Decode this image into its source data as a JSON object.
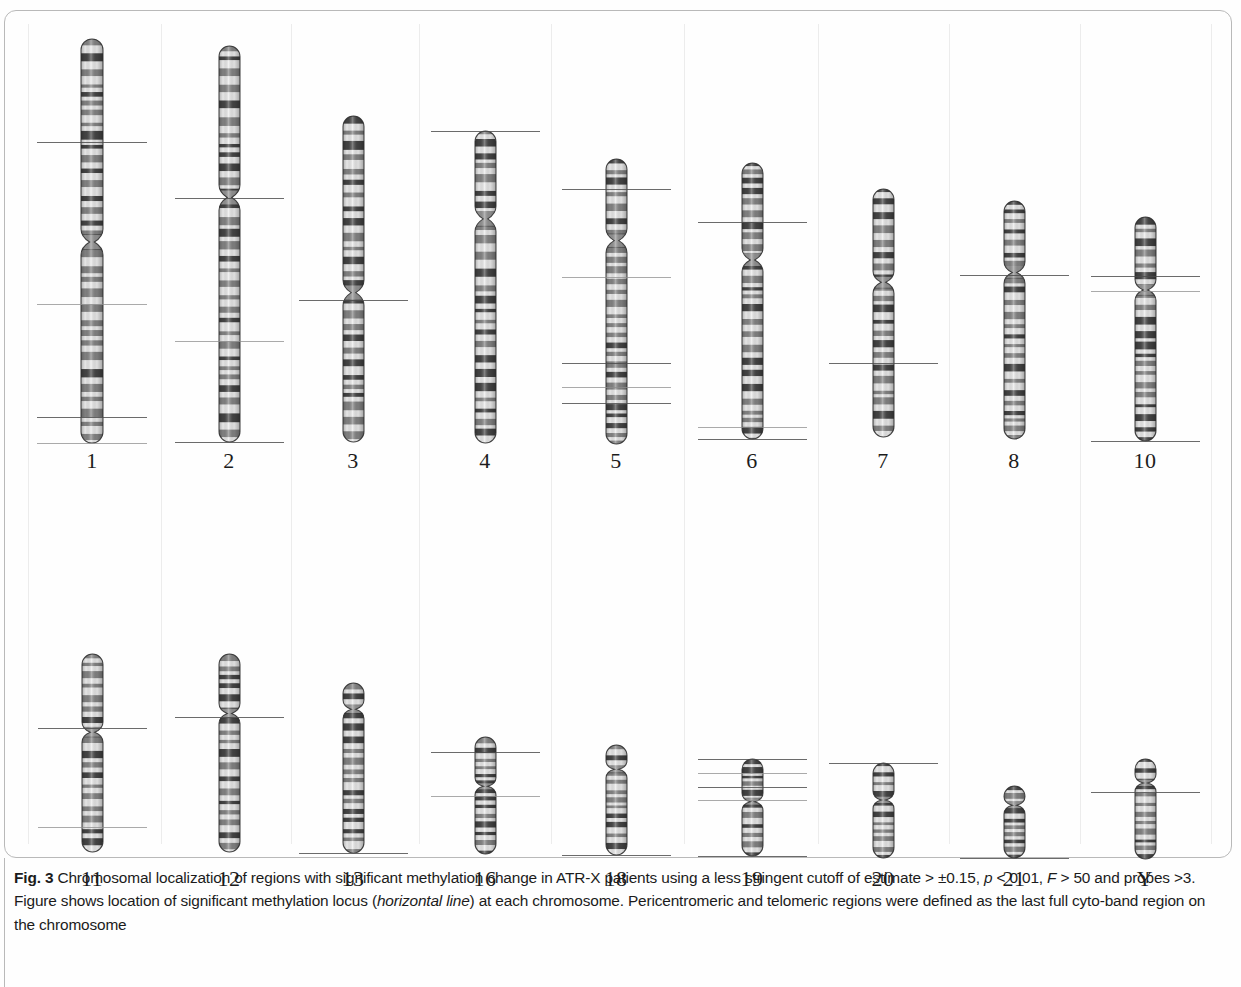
{
  "figure": {
    "label": "Fig. 3",
    "caption_part1": "Chromosomal localization of regions with significant methylation change in ATR-X patients using a less stringent cutoff of estimate > ±0.15,",
    "caption_part2_a": "p",
    "caption_part2_b": " < 0.01, ",
    "caption_part2_c": "F",
    "caption_part2_d": " > 50 and probes >3. Figure shows location of significant methylation locus (",
    "caption_italic_term": "horizontal line",
    "caption_part2_e": ") at each chromosome. Pericentromeric and",
    "caption_part3": "telomeric regions were defined as the last full cyto-band region on the chromosome"
  },
  "chart_data": {
    "type": "diagram",
    "title": "Chromosomal localization of regions with significant methylation change in ATR-X patients",
    "rows": [
      {
        "row_index": 0,
        "chromosomes": [
          {
            "name": "1",
            "x_center": 88,
            "top": 28,
            "length": 404,
            "width": 22,
            "centromere_frac": 0.505,
            "marker_fracs": [
              0.255,
              0.655,
              0.935,
              1.0
            ],
            "marker_count": 4
          },
          {
            "name": "2",
            "x_center": 225,
            "top": 35,
            "length": 396,
            "width": 21,
            "centromere_frac": 0.385,
            "marker_fracs": [
              0.385,
              0.745,
              1.0
            ],
            "marker_count": 3
          },
          {
            "name": "3",
            "x_center": 349,
            "top": 105,
            "length": 326,
            "width": 21,
            "centromere_frac": 0.545,
            "marker_fracs": [
              0.565
            ],
            "marker_count": 1
          },
          {
            "name": "4",
            "x_center": 481,
            "top": 120,
            "length": 312,
            "width": 21,
            "centromere_frac": 0.285,
            "marker_fracs": [
              0.0
            ],
            "marker_count": 1
          },
          {
            "name": "5",
            "x_center": 612,
            "top": 148,
            "length": 285,
            "width": 21,
            "centromere_frac": 0.29,
            "marker_fracs": [
              0.105,
              0.415,
              0.715,
              0.8,
              0.855
            ],
            "marker_count": 5
          },
          {
            "name": "6",
            "x_center": 748,
            "top": 152,
            "length": 276,
            "width": 21,
            "centromere_frac": 0.355,
            "marker_fracs": [
              0.215,
              0.955,
              1.0
            ],
            "marker_count": 3
          },
          {
            "name": "7",
            "x_center": 879,
            "top": 178,
            "length": 248,
            "width": 21,
            "centromere_frac": 0.38,
            "marker_fracs": [
              0.7
            ],
            "marker_count": 1
          },
          {
            "name": "8",
            "x_center": 1010,
            "top": 190,
            "length": 238,
            "width": 21,
            "centromere_frac": 0.305,
            "marker_fracs": [
              0.31
            ],
            "marker_count": 1
          },
          {
            "name": "10",
            "x_center": 1141,
            "top": 206,
            "length": 224,
            "width": 21,
            "centromere_frac": 0.33,
            "marker_fracs": [
              0.265,
              0.33,
              1.0
            ],
            "marker_count": 3
          }
        ]
      },
      {
        "row_index": 1,
        "chromosomes": [
          {
            "name": "11",
            "x_center": 88,
            "top": 643,
            "length": 198,
            "width": 21,
            "centromere_frac": 0.4,
            "marker_fracs": [
              0.375,
              0.875
            ],
            "marker_count": 2
          },
          {
            "name": "12",
            "x_center": 225,
            "top": 643,
            "length": 198,
            "width": 21,
            "centromere_frac": 0.305,
            "marker_fracs": [
              0.32
            ],
            "marker_count": 1
          },
          {
            "name": "13",
            "x_center": 349,
            "top": 672,
            "length": 170,
            "width": 21,
            "centromere_frac": 0.16,
            "marker_fracs": [
              1.0
            ],
            "marker_count": 1
          },
          {
            "name": "16",
            "x_center": 481,
            "top": 726,
            "length": 117,
            "width": 21,
            "centromere_frac": 0.43,
            "marker_fracs": [
              0.13,
              0.5
            ],
            "marker_count": 2
          },
          {
            "name": "18",
            "x_center": 612,
            "top": 734,
            "length": 110,
            "width": 21,
            "centromere_frac": 0.23,
            "marker_fracs": [
              1.0
            ],
            "marker_count": 1
          },
          {
            "name": "19",
            "x_center": 748,
            "top": 748,
            "length": 97,
            "width": 21,
            "centromere_frac": 0.45,
            "marker_fracs": [
              0.0,
              0.14,
              0.29,
              0.42,
              1.0
            ],
            "marker_count": 5
          },
          {
            "name": "20",
            "x_center": 879,
            "top": 752,
            "length": 95,
            "width": 21,
            "centromere_frac": 0.4,
            "marker_fracs": [
              0.0
            ],
            "marker_count": 1
          },
          {
            "name": "21",
            "x_center": 1010,
            "top": 775,
            "length": 72,
            "width": 21,
            "centromere_frac": 0.28,
            "marker_fracs": [
              1.0
            ],
            "marker_count": 1
          },
          {
            "name": "Y",
            "x_center": 1141,
            "top": 748,
            "length": 100,
            "width": 21,
            "centromere_frac": 0.25,
            "marker_fracs": [
              0.33
            ],
            "marker_count": 1
          }
        ]
      }
    ],
    "row_label_y": [
      448,
      866
    ],
    "total_chromosomes": 18,
    "legend": "horizontal line = location of significant methylation locus"
  },
  "colors": {
    "band_dark": "#3a3a3a",
    "band_mid": "#7c7c7c",
    "band_light": "#d8d8d8",
    "outline": "#2b2b2b",
    "marker_line": "#4a4a4a",
    "frame": "#b9b9b9",
    "background": "#fefefe",
    "text": "#1b1b1b"
  }
}
